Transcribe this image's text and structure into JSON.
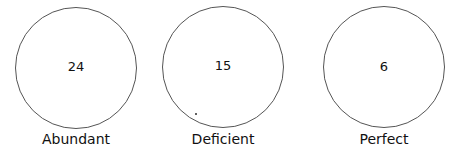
{
  "diagram": {
    "circles": [
      {
        "value": "24",
        "label": "Abundant"
      },
      {
        "value": "15",
        "label": "Deficient"
      },
      {
        "value": "6",
        "label": "Perfect"
      }
    ]
  }
}
